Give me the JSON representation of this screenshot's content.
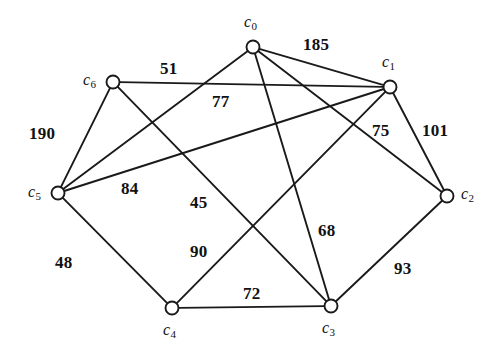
{
  "figure": {
    "type": "weighted-undirected-graph",
    "background": "#ffffff",
    "stroke_color": "#1a1a1a",
    "width": 499,
    "height": 356
  },
  "nodes": [
    {
      "id": "c0",
      "label": "c",
      "sub": "0",
      "x": 253,
      "y": 47,
      "label_x": 244,
      "label_y": 14
    },
    {
      "id": "c1",
      "label": "c",
      "sub": "1",
      "x": 390,
      "y": 87,
      "label_x": 382,
      "label_y": 54
    },
    {
      "id": "c2",
      "label": "c",
      "sub": "2",
      "x": 447,
      "y": 196,
      "label_x": 461,
      "label_y": 186
    },
    {
      "id": "c3",
      "label": "c",
      "sub": "3",
      "x": 331,
      "y": 306,
      "label_x": 322,
      "label_y": 320
    },
    {
      "id": "c4",
      "label": "c",
      "sub": "4",
      "x": 172,
      "y": 308,
      "label_x": 163,
      "label_y": 322
    },
    {
      "id": "c5",
      "label": "c",
      "sub": "5",
      "x": 58,
      "y": 193,
      "label_x": 28,
      "label_y": 184
    },
    {
      "id": "c6",
      "label": "c",
      "sub": "6",
      "x": 113,
      "y": 82,
      "label_x": 83,
      "label_y": 72
    }
  ],
  "edges": [
    {
      "from": "c0",
      "to": "c1",
      "weight": "185",
      "label_x": 303,
      "label_y": 36
    },
    {
      "from": "c0",
      "to": "c2",
      "weight": "77",
      "label_x": 212,
      "label_y": 93
    },
    {
      "from": "c0",
      "to": "c3",
      "weight": "68",
      "label_x": 318,
      "label_y": 222
    },
    {
      "from": "c0",
      "to": "c5",
      "weight": "45",
      "label_x": 190,
      "label_y": 194
    },
    {
      "from": "c6",
      "to": "c1",
      "weight": "51",
      "label_x": 160,
      "label_y": 60
    },
    {
      "from": "c6",
      "to": "c5",
      "weight": "190",
      "label_x": 29,
      "label_y": 125
    },
    {
      "from": "c6",
      "to": "c3",
      "weight": "84",
      "label_x": 121,
      "label_y": 180
    },
    {
      "from": "c5",
      "to": "c1",
      "weight": "75",
      "label_x": 372,
      "label_y": 122
    },
    {
      "from": "c5",
      "to": "c4",
      "weight": "48",
      "label_x": 55,
      "label_y": 254
    },
    {
      "from": "c4",
      "to": "c3",
      "weight": "72",
      "label_x": 243,
      "label_y": 285
    },
    {
      "from": "c4",
      "to": "c1",
      "weight": "90",
      "label_x": 190,
      "label_y": 243
    },
    {
      "from": "c3",
      "to": "c2",
      "weight": "93",
      "label_x": 394,
      "label_y": 260
    },
    {
      "from": "c1",
      "to": "c2",
      "weight": "101",
      "label_x": 422,
      "label_y": 122
    }
  ]
}
